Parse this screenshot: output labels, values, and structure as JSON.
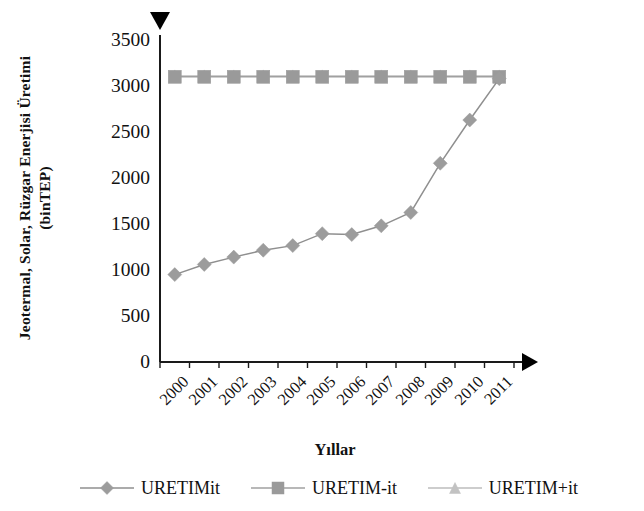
{
  "chart_data": {
    "type": "line",
    "title": "",
    "xlabel": "Yıllar",
    "ylabel": "Jeotermal, Solar, Rüzgar Enerjisi Üretimi\n(binTEP)",
    "categories": [
      "2000",
      "2001",
      "2002",
      "2003",
      "2004",
      "2005",
      "2006",
      "2007",
      "2008",
      "2009",
      "2010",
      "2011"
    ],
    "ylim": [
      0,
      3500
    ],
    "yticks": [
      0,
      500,
      1000,
      1500,
      2000,
      2500,
      3000,
      3500
    ],
    "ytick_labels": [
      "0",
      "500",
      "1000",
      "1500",
      "2000",
      "2500",
      "3000",
      "3500"
    ],
    "grid": false,
    "legend_position": "bottom",
    "series": [
      {
        "name": "URETIMit",
        "marker": "diamond",
        "color": "#9c9c9c",
        "line_color": "#8f8f8f",
        "values": [
          950,
          1060,
          1140,
          1215,
          1265,
          1395,
          1385,
          1480,
          1625,
          2160,
          2630,
          3080
        ]
      },
      {
        "name": "URETIM-it",
        "marker": "square",
        "color": "#9a9a9a",
        "line_color": "#a0a0a0",
        "values": [
          3100,
          3100,
          3100,
          3100,
          3100,
          3100,
          3100,
          3100,
          3100,
          3100,
          3100,
          3100
        ]
      },
      {
        "name": "URETIM+it",
        "marker": "triangle",
        "color": "#c2c2c2",
        "line_color": "#bdbdbd",
        "values": [
          3110,
          3110,
          3110,
          3110,
          3110,
          3110,
          3110,
          3110,
          3110,
          3110,
          3110,
          3110
        ]
      }
    ],
    "annotations": [
      {
        "name": "y-axis-arrow",
        "shape": "triangle-down",
        "color": "#000000"
      },
      {
        "name": "x-axis-arrow",
        "shape": "triangle-right",
        "color": "#000000"
      }
    ]
  },
  "axis": {
    "title_y": "Jeotermal, Solar, Rüzgar Enerjisi Üretimi\n(binTEP)",
    "title_x": "Yıllar"
  },
  "legend": {
    "items": [
      {
        "label": "URETIMit",
        "marker": "diamond-icon"
      },
      {
        "label": "URETIM-it",
        "marker": "square-icon"
      },
      {
        "label": "URETIM+it",
        "marker": "triangle-icon"
      }
    ]
  }
}
